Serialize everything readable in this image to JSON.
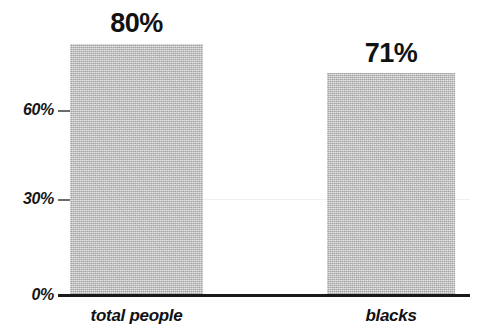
{
  "chart_data": {
    "type": "bar",
    "title": "",
    "subtitle": "",
    "xlabel": "",
    "ylabel": "",
    "categories": [
      "total people",
      "blacks"
    ],
    "values": [
      80,
      71
    ],
    "value_labels": [
      "80%",
      "71%"
    ],
    "ytick_values": [
      0,
      30,
      60
    ],
    "ytick_labels": [
      "0%",
      "30%",
      "60%"
    ],
    "ylim": [
      0,
      80
    ],
    "grid": true,
    "gridlines_at": [
      30
    ],
    "legend": null,
    "annotations": [],
    "colors": {
      "bar_fill": "#c2c2c2",
      "axis": "#1a1a1a",
      "text": "#121212",
      "gridline": "#efefef",
      "background": "#ffffff"
    }
  }
}
